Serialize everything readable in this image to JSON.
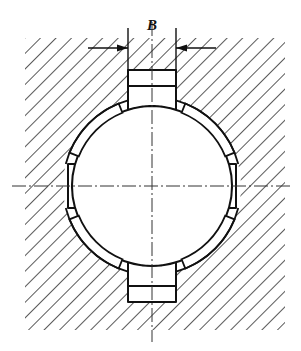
{
  "drawing": {
    "type": "engineering-cross-section",
    "subject": "splined shaft in hub, sectional view",
    "background_color": "#ffffff",
    "line_color": "#111111",
    "hatch_color": "#222222",
    "canvas": {
      "width": 301,
      "height": 351
    }
  },
  "labels": {
    "dimension_b": "B"
  },
  "dimension": {
    "name": "B",
    "extension_line_left_x": 128,
    "extension_line_right_x": 176,
    "extension_line_top_y": 28,
    "extension_line_bottom_y": 78,
    "dimension_line_y": 48,
    "arrow_direction": "inward",
    "leader_left_start_x": 88,
    "leader_right_end_x": 216,
    "label_x": 152,
    "label_y": 30
  },
  "hub": {
    "name": "hub-section",
    "x": 25,
    "y": 38,
    "width": 260,
    "height": 292,
    "hatch_angle_deg": 45,
    "hatch_direction": "backslash",
    "hatch_spacing": 11,
    "hatch_line_width": 1.5
  },
  "shaft": {
    "name": "shaft-section",
    "center_x": 152,
    "center_y": 186,
    "radius": 80,
    "hatch_angle_deg": 45,
    "hatch_direction": "backslash",
    "hatch_spacing": 17,
    "hatch_line_width": 1.4
  },
  "splines": {
    "count": 4,
    "teeth": [
      {
        "position": "top",
        "angle_deg": 270,
        "half_width": 24,
        "tip_offset": 42
      },
      {
        "position": "bottom",
        "angle_deg": 90,
        "half_width": 24,
        "tip_offset": 42
      },
      {
        "position": "left",
        "angle_deg": 180,
        "half_width": 22,
        "tip_offset": 10
      },
      {
        "position": "right",
        "angle_deg": 0,
        "half_width": 22,
        "tip_offset": 10
      }
    ]
  },
  "clearance_gaps": {
    "count": 4,
    "description": "crescent clearance arcs between shaft outer diameter and hub bore",
    "angles_deg": [
      45,
      135,
      225,
      315
    ]
  },
  "centerlines": {
    "style": "dash-dot",
    "horizontal": {
      "y": 186,
      "x_start": 12,
      "x_end": 292
    },
    "vertical": {
      "x": 152,
      "y_start": 22,
      "y_end": 342
    }
  }
}
